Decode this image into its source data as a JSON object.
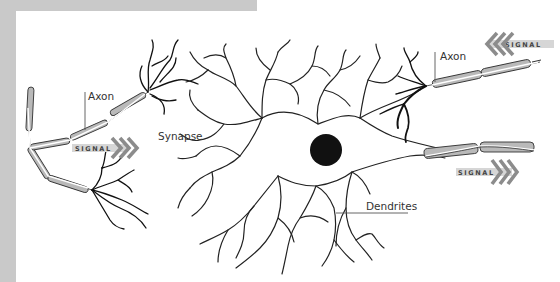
{
  "diagram": {
    "labels": {
      "axon_left": "Axon",
      "axon_right": "Axon",
      "synapse": "Synapse",
      "dendrites": "Dendrites"
    },
    "signals": [
      {
        "id": "signal-left",
        "text": "SIGNAL",
        "direction": "right"
      },
      {
        "id": "signal-top-right",
        "text": "SIGNAL",
        "direction": "left"
      },
      {
        "id": "signal-bottom-right",
        "text": "SIGNAL",
        "direction": "right"
      }
    ],
    "colors": {
      "frame": "#c9c9c9",
      "myelin": "#b9b9b9",
      "arrow": "#8c8c8c",
      "nucleus": "#111111",
      "line": "#222222",
      "background": "#ffffff"
    }
  }
}
